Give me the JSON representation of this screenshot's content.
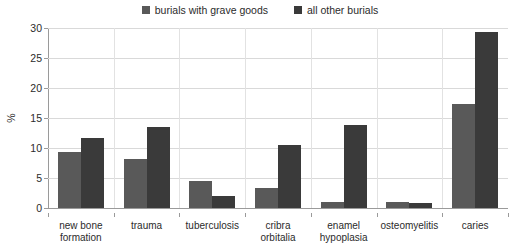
{
  "chart_data": {
    "type": "bar",
    "title": "",
    "xlabel": "",
    "ylabel": "%",
    "ylim": [
      0,
      30
    ],
    "yticks": [
      0,
      5,
      10,
      15,
      20,
      25,
      30
    ],
    "grid": true,
    "legend_position": "top-center",
    "categories": [
      "new bone formation",
      "trauma",
      "tuberculosis",
      "cribra orbitalia",
      "enamel hypoplasia",
      "osteomyelitis",
      "caries"
    ],
    "category_lines": [
      [
        "new bone",
        "formation"
      ],
      [
        "trauma"
      ],
      [
        "tuberculosis"
      ],
      [
        "cribra",
        "orbitalia"
      ],
      [
        "enamel",
        "hypoplasia"
      ],
      [
        "osteomyelitis"
      ],
      [
        "caries"
      ]
    ],
    "series": [
      {
        "name": "burials with grave goods",
        "color": "#595959",
        "values": [
          9.3,
          8.2,
          4.5,
          3.3,
          1.0,
          1.0,
          17.3
        ]
      },
      {
        "name": "all other burials",
        "color": "#3a3a3a",
        "values": [
          11.7,
          13.5,
          2.0,
          10.5,
          13.8,
          0.8,
          29.3
        ]
      }
    ]
  },
  "legend": {
    "entries": [
      {
        "label": "burials with grave goods",
        "color": "#595959"
      },
      {
        "label": "all other burials",
        "color": "#3a3a3a"
      }
    ]
  },
  "axes": {
    "y_title": "%",
    "y_tick_labels": [
      "30",
      "25",
      "20",
      "15",
      "10",
      "5",
      "0"
    ]
  },
  "colors": {
    "series_a": "#595959",
    "series_b": "#3a3a3a",
    "gridline": "#d9d9d9",
    "axis": "#9a9a9a",
    "text": "#2b2b2b",
    "background": "#ffffff"
  }
}
